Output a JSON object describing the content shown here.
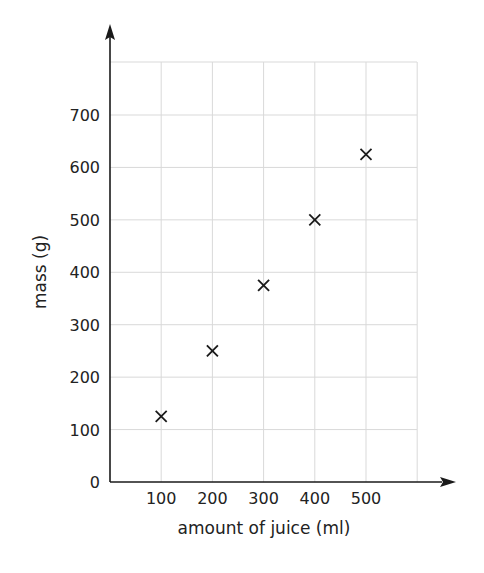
{
  "chart_data": {
    "type": "scatter",
    "title": "",
    "xlabel": "amount of juice (ml)",
    "ylabel": "mass (g)",
    "xlim": [
      0,
      600
    ],
    "ylim": [
      0,
      800
    ],
    "xticks": [
      100,
      200,
      300,
      400,
      500
    ],
    "yticks": [
      0,
      100,
      200,
      300,
      400,
      500,
      600,
      700
    ],
    "grid": true,
    "legend": null,
    "marker": "x",
    "series": [
      {
        "name": "mass vs amount of juice",
        "x": [
          100,
          200,
          300,
          400,
          500
        ],
        "y": [
          125,
          250,
          375,
          500,
          625
        ]
      }
    ]
  },
  "colors": {
    "axis": "#1a1a1a",
    "grid": "#d9d9d9",
    "marker": "#1a1a1a",
    "text": "#222222"
  }
}
